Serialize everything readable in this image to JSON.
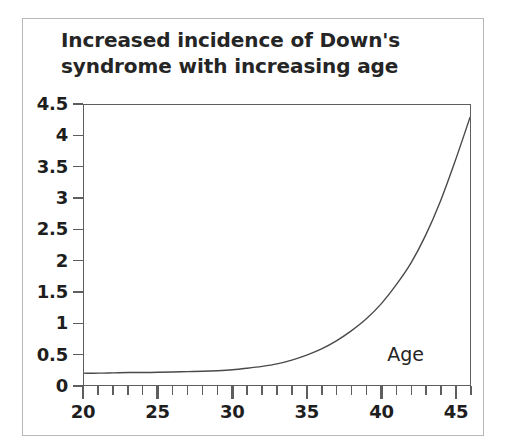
{
  "chart_data": {
    "type": "line",
    "title": "Increased incidence of Down's syndrome with increasing age",
    "title_line1": "Increased incidence of Down's",
    "title_line2": "syndrome with increasing age",
    "xlabel": "Age",
    "ylabel": "% Down's syndrome",
    "xlim": [
      20,
      46
    ],
    "ylim": [
      0,
      4.5
    ],
    "grid": false,
    "legend": null,
    "x_tick_labels": [
      "20",
      "25",
      "30",
      "35",
      "40",
      "45"
    ],
    "x_tick_values": [
      20,
      25,
      30,
      35,
      40,
      45
    ],
    "x_minor_tick_step": 1,
    "y_tick_labels": [
      "0",
      "0.5",
      "1",
      "1.5",
      "2",
      "2.5",
      "3",
      "3.5",
      "4",
      "4.5"
    ],
    "y_tick_values": [
      0,
      0.5,
      1,
      1.5,
      2,
      2.5,
      3,
      3.5,
      4,
      4.5
    ],
    "line_color": "#4a4a4a",
    "x": [
      20,
      21,
      22,
      23,
      24,
      25,
      26,
      27,
      28,
      29,
      30,
      31,
      32,
      33,
      34,
      35,
      36,
      37,
      38,
      39,
      40,
      41,
      42,
      43,
      44,
      45,
      46
    ],
    "values": [
      0.19,
      0.19,
      0.195,
      0.2,
      0.2,
      0.205,
      0.21,
      0.215,
      0.22,
      0.23,
      0.245,
      0.27,
      0.3,
      0.34,
      0.4,
      0.48,
      0.58,
      0.71,
      0.87,
      1.06,
      1.3,
      1.6,
      1.95,
      2.4,
      2.95,
      3.6,
      4.3
    ],
    "series": [
      {
        "name": "% Down's syndrome",
        "values": [
          0.19,
          0.19,
          0.195,
          0.2,
          0.2,
          0.205,
          0.21,
          0.215,
          0.22,
          0.23,
          0.245,
          0.27,
          0.3,
          0.34,
          0.4,
          0.48,
          0.58,
          0.71,
          0.87,
          1.06,
          1.3,
          1.6,
          1.95,
          2.4,
          2.95,
          3.6,
          4.3
        ]
      }
    ]
  }
}
